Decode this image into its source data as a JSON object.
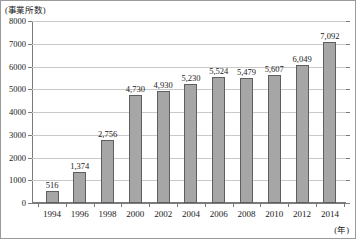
{
  "chart_data": {
    "type": "bar",
    "title": "",
    "subtitle": "",
    "xlabel": "(年)",
    "ylabel": "(事業所数)",
    "categories": [
      "1994",
      "1996",
      "1998",
      "2000",
      "2002",
      "2004",
      "2006",
      "2008",
      "2010",
      "2012",
      "2014"
    ],
    "values": [
      516,
      1374,
      2756,
      4730,
      4930,
      5230,
      5524,
      5479,
      5607,
      6049,
      7092
    ],
    "value_labels": [
      "516",
      "1,374",
      "2,756",
      "4,730",
      "4,930",
      "5,230",
      "5,524",
      "5,479",
      "5,607",
      "6,049",
      "7,092"
    ],
    "ylim": [
      0,
      8000
    ],
    "ytick_values": [
      0,
      1000,
      2000,
      3000,
      4000,
      5000,
      6000,
      7000,
      8000
    ],
    "ytick_labels": [
      "0",
      "1000",
      "2000",
      "3000",
      "4000",
      "5000",
      "6000",
      "7000",
      "8000"
    ],
    "grid": "horizontal",
    "legend": "none",
    "bar_fill_color": "#a6a6a6",
    "bar_border_color": "#5f5f5f",
    "gridline_color": "#c9c9c9",
    "axis_color": "#7b7b7b",
    "text_color": "#1a1a1a"
  }
}
